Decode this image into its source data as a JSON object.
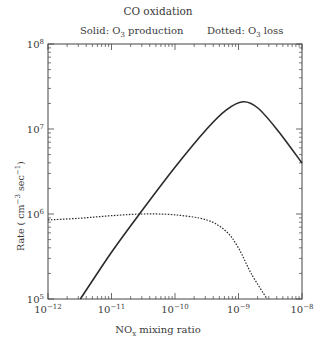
{
  "chart_data": {
    "type": "line",
    "title": "CO oxidation",
    "xlabel": "NO_x mixing ratio",
    "ylabel": "Rate ( cm^-3 sec^-1)",
    "xscale": "log",
    "yscale": "log",
    "xlim": [
      1e-12,
      1e-08
    ],
    "ylim": [
      100000.0,
      100000000.0
    ],
    "grid": false,
    "legend_position": "top",
    "x_tick_labels": [
      "10^-12",
      "10^-11",
      "10^-10",
      "10^-9",
      "10^-8"
    ],
    "y_tick_labels": [
      "10^5",
      "10^6",
      "10^7",
      "10^8"
    ],
    "series": [
      {
        "name": "O3 production",
        "style": "solid",
        "log10_x": [
          -11.49,
          -11.0,
          -10.56,
          -10.0,
          -9.5,
          -9.2,
          -8.93,
          -8.7,
          -8.4,
          -8.0
        ],
        "log10_y": [
          5.0,
          5.55,
          6.0,
          6.55,
          7.0,
          7.22,
          7.32,
          7.25,
          7.0,
          6.6
        ]
      },
      {
        "name": "O3 loss",
        "style": "dotted",
        "log10_x": [
          -12.0,
          -11.5,
          -11.0,
          -10.5,
          -10.0,
          -9.5,
          -9.2,
          -9.0,
          -8.8,
          -8.55
        ],
        "log10_y": [
          5.93,
          5.95,
          5.98,
          6.0,
          5.99,
          5.93,
          5.8,
          5.6,
          5.3,
          5.0
        ]
      }
    ],
    "annotations": [
      "Solid: O3 production",
      "Dotted: O3 loss"
    ]
  },
  "labels": {
    "title": "CO oxidation",
    "legend_solid_prefix": "Solid: O",
    "legend_solid_sub": "3",
    "legend_solid_suffix": " production",
    "legend_dotted_prefix": "Dotted: O",
    "legend_dotted_sub": "3",
    "legend_dotted_suffix": " loss",
    "xlabel_main": "NO",
    "xlabel_sub": "x",
    "xlabel_suffix": " mixing ratio",
    "ylabel_a": "Rate ( cm",
    "ylabel_sup1": "−3",
    "ylabel_b": " sec",
    "ylabel_sup2": "−1",
    "ylabel_c": ")"
  },
  "axes": {
    "x_ticks": [
      {
        "base": "10",
        "exp": "−12"
      },
      {
        "base": "10",
        "exp": "−11"
      },
      {
        "base": "10",
        "exp": "−10"
      },
      {
        "base": "10",
        "exp": "−9"
      },
      {
        "base": "10",
        "exp": "−8"
      }
    ],
    "y_ticks": [
      {
        "base": "10",
        "exp": "5"
      },
      {
        "base": "10",
        "exp": "6"
      },
      {
        "base": "10",
        "exp": "7"
      },
      {
        "base": "10",
        "exp": "8"
      }
    ]
  }
}
